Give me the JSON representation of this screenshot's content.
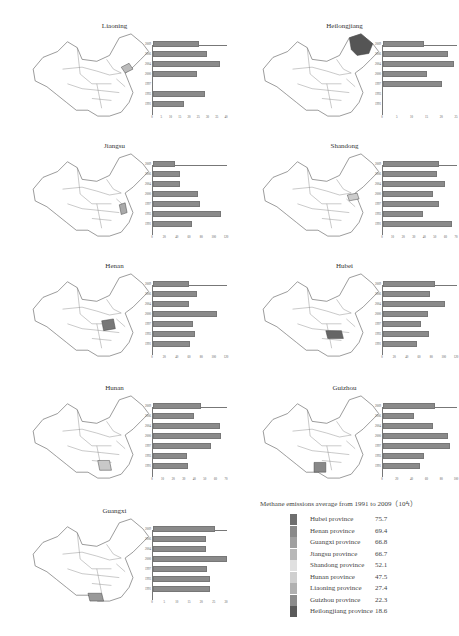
{
  "chart_data": {
    "type": "bar",
    "categories": [
      "2009",
      "2006",
      "2004",
      "2000",
      "1997",
      "1993",
      "1991"
    ],
    "panels": [
      {
        "name": "Liaoning",
        "xlim": [
          0,
          40
        ],
        "ticks": [
          0,
          5,
          10,
          15,
          20,
          25,
          30,
          35,
          40
        ],
        "values": [
          25,
          29,
          36,
          24,
          null,
          28,
          17
        ],
        "map_shade": "#bbbbbb"
      },
      {
        "name": "Heilongjiang",
        "xlim": [
          0,
          25
        ],
        "ticks": [
          0,
          5,
          10,
          15,
          20,
          25
        ],
        "values": [
          14,
          22,
          24,
          15,
          20,
          null,
          null
        ],
        "map_shade": "#555555"
      },
      {
        "name": "Jiangsu",
        "xlim": [
          0,
          120
        ],
        "ticks": [
          0,
          20,
          40,
          60,
          80,
          100,
          120
        ],
        "values": [
          35,
          44,
          43,
          73,
          77,
          110,
          64
        ],
        "map_shade": "#aaaaaa"
      },
      {
        "name": "Shandong",
        "xlim": [
          0,
          70
        ],
        "ticks": [
          0,
          10,
          20,
          30,
          40,
          50,
          60,
          70
        ],
        "values": [
          53,
          51,
          59,
          47,
          53,
          38,
          65
        ],
        "map_shade": "#cccccc"
      },
      {
        "name": "Henan",
        "xlim": [
          0,
          120
        ],
        "ticks": [
          0,
          20,
          40,
          60,
          80,
          100,
          120
        ],
        "values": [
          58,
          71,
          59,
          103,
          65,
          68,
          60
        ],
        "map_shade": "#777777"
      },
      {
        "name": "Hubei",
        "xlim": [
          0,
          120
        ],
        "ticks": [
          0,
          20,
          40,
          60,
          80,
          100,
          120
        ],
        "values": [
          84,
          76,
          100,
          73,
          62,
          74,
          55
        ],
        "map_shade": "#666666"
      },
      {
        "name": "Hunan",
        "xlim": [
          0,
          70
        ],
        "ticks": [
          0,
          10,
          20,
          30,
          40,
          50,
          60,
          70
        ],
        "values": [
          45,
          39,
          63,
          64,
          55,
          32,
          33
        ],
        "map_shade": "#c8c8c8"
      },
      {
        "name": "Guizhou",
        "xlim": [
          0,
          100
        ],
        "ticks": [
          0,
          20,
          40,
          60,
          80,
          100
        ],
        "values": [
          70,
          42,
          67,
          88,
          91,
          56,
          50
        ],
        "map_shade": "#888888"
      },
      {
        "name": "Guangxi",
        "xlim": [
          0,
          30
        ],
        "ticks": [
          0,
          5,
          10,
          15,
          20,
          25,
          30
        ],
        "values": [
          25,
          21.5,
          21.5,
          30,
          22,
          23,
          23
        ],
        "map_shade": "#999999"
      }
    ],
    "legend": {
      "title": "Methane emissions average from 1991 to 2009（10⁴t）",
      "items": [
        {
          "label": "Hubei province",
          "value": 75.7,
          "color": "#6e6e6e"
        },
        {
          "label": "Henan province",
          "value": 69.4,
          "color": "#8a8a8a"
        },
        {
          "label": "Guangxi province",
          "value": 66.8,
          "color": "#a0a0a0"
        },
        {
          "label": "Jiangsu province",
          "value": 66.7,
          "color": "#b8b8b8"
        },
        {
          "label": "Shandong province",
          "value": 52.1,
          "color": "#e0e0e0"
        },
        {
          "label": "Hunan province",
          "value": 47.5,
          "color": "#cfcfcf"
        },
        {
          "label": "Liaoning province",
          "value": 27.4,
          "color": "#b0b0b0"
        },
        {
          "label": "Guizhou province",
          "value": 22.3,
          "color": "#8c8c8c"
        },
        {
          "label": "Heilongjiang province",
          "value": 18.6,
          "color": "#5a5a5a"
        }
      ]
    }
  }
}
